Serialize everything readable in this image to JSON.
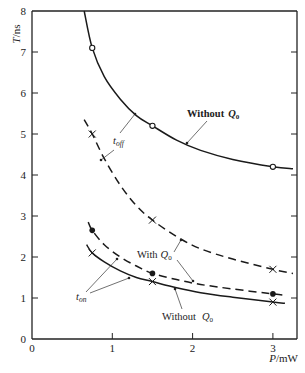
{
  "chart_data": {
    "type": "line",
    "title": "",
    "xlabel": "P/mW",
    "ylabel": "T/ns",
    "xlim": [
      0,
      3.3
    ],
    "ylim": [
      0,
      8
    ],
    "x_ticks": [
      "0",
      "1",
      "2",
      "3"
    ],
    "y_ticks": [
      "0",
      "1",
      "2",
      "3",
      "4",
      "5",
      "6",
      "7",
      "8"
    ],
    "grid": false,
    "series": [
      {
        "name": "t_off Without Q0",
        "style": "solid",
        "marker": "open-circle",
        "x": [
          0.75,
          1.5,
          3.0
        ],
        "y": [
          7.1,
          5.2,
          4.2
        ],
        "curve_x": [
          0.65,
          0.75,
          0.9,
          1.1,
          1.3,
          1.5,
          1.8,
          2.1,
          2.5,
          3.0,
          3.25
        ],
        "curve_y": [
          8.0,
          7.1,
          6.4,
          5.85,
          5.45,
          5.2,
          4.85,
          4.6,
          4.38,
          4.2,
          4.15
        ]
      },
      {
        "name": "t_off With Q0",
        "style": "dashed",
        "marker": "x",
        "x": [
          0.75,
          1.5,
          3.0
        ],
        "y": [
          5.0,
          2.9,
          1.7
        ],
        "curve_x": [
          0.65,
          0.75,
          0.9,
          1.1,
          1.3,
          1.5,
          1.8,
          2.1,
          2.5,
          3.0,
          3.25
        ],
        "curve_y": [
          5.35,
          5.0,
          4.4,
          3.75,
          3.25,
          2.9,
          2.5,
          2.2,
          1.95,
          1.7,
          1.6
        ]
      },
      {
        "name": "t_on With Q0",
        "style": "dashed",
        "marker": "filled-circle",
        "x": [
          0.75,
          1.5,
          3.0
        ],
        "y": [
          2.65,
          1.6,
          1.1
        ],
        "curve_x": [
          0.7,
          0.75,
          0.9,
          1.1,
          1.3,
          1.5,
          1.8,
          2.1,
          2.5,
          3.0,
          3.15
        ],
        "curve_y": [
          2.85,
          2.65,
          2.3,
          2.0,
          1.78,
          1.6,
          1.45,
          1.33,
          1.22,
          1.1,
          1.07
        ]
      },
      {
        "name": "t_on Without Q0",
        "style": "solid",
        "marker": "x",
        "x": [
          0.75,
          1.5,
          3.0
        ],
        "y": [
          2.1,
          1.4,
          0.9
        ],
        "curve_x": [
          0.68,
          0.75,
          0.9,
          1.1,
          1.3,
          1.5,
          1.8,
          2.1,
          2.5,
          3.0,
          3.15
        ],
        "curve_y": [
          2.3,
          2.1,
          1.88,
          1.66,
          1.5,
          1.4,
          1.25,
          1.13,
          1.02,
          0.9,
          0.87
        ]
      }
    ],
    "annotations": [
      {
        "text": "Without Q0",
        "label_id": "without_q0_top"
      },
      {
        "text": "t_off",
        "label_id": "t_off"
      },
      {
        "text": "With Q0",
        "label_id": "with_q0"
      },
      {
        "text": "t_on",
        "label_id": "t_on"
      },
      {
        "text": "Without Q0",
        "label_id": "without_q0_bottom"
      }
    ]
  },
  "labels": {
    "ylabel_main": "T",
    "ylabel_unit": "/ns",
    "xlabel_main": "P",
    "xlabel_unit": "/mW",
    "without_q0_top_word": "Without",
    "without_q0_top_q": "Q",
    "without_q0_top_sub": "0",
    "t_off_main": "t",
    "t_off_sub": "off",
    "with_q0_word": "With",
    "with_q0_q": "Q",
    "with_q0_sub": "0",
    "t_on_main": "t",
    "t_on_sub": "on",
    "without_q0_bottom_word": "Without",
    "without_q0_bottom_q": "Q",
    "without_q0_bottom_sub": "0"
  }
}
